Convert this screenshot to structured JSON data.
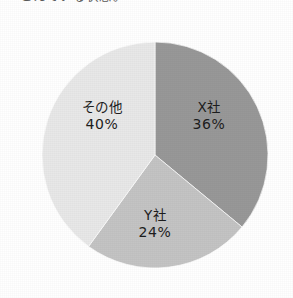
{
  "caption": {
    "clipped_text": "こえている状態。",
    "note_visible": "bottom pixel row only, clipped by page edge"
  },
  "chart_data": {
    "type": "pie",
    "title": "",
    "subtitle": "",
    "xlabel": "",
    "ylabel": "",
    "legend": "none",
    "grid": false,
    "start_angle_oclock": 12,
    "direction": "clockwise",
    "unit": "%",
    "categories": [
      "X社",
      "Y社",
      "その他"
    ],
    "values": [
      36,
      24,
      40
    ],
    "slices": [
      {
        "name": "X社",
        "label": "X社",
        "value": 36,
        "value_text": "36%",
        "color": "#989898",
        "start_pct": 0,
        "end_pct": 36
      },
      {
        "name": "Y社",
        "label": "Y社",
        "value": 24,
        "value_text": "24%",
        "color": "#c4c4c4",
        "start_pct": 36,
        "end_pct": 60
      },
      {
        "name": "その他",
        "label": "その他",
        "value": 40,
        "value_text": "40%",
        "color": "#e8e8e8",
        "start_pct": 60,
        "end_pct": 100
      }
    ],
    "geometry": {
      "center_x": 155,
      "center_y": 155,
      "radius": 113
    },
    "colors": {
      "background": "#ffffff",
      "text": "#1d1d1d",
      "caption_text": "#5a5a5a"
    }
  }
}
